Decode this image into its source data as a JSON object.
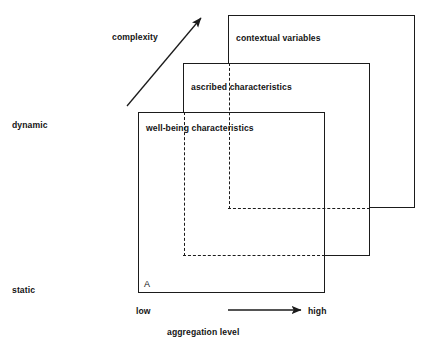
{
  "figure": {
    "clipped_title": "social architecture",
    "corner_mark": "14",
    "boxes": [
      {
        "id": "contextual",
        "label": "contextual variables"
      },
      {
        "id": "ascribed",
        "label": "ascribed characteristics"
      },
      {
        "id": "wellbeing",
        "label": "well-being characteristics"
      }
    ],
    "annotations": {
      "complexity": "complexity",
      "point_marker": "A"
    },
    "y_axis": {
      "top_label": "dynamic",
      "bottom_label": "static"
    },
    "x_axis": {
      "low_label": "low",
      "high_label": "high",
      "caption": "aggregation level"
    },
    "colors": {
      "line": "#1b1b1b",
      "text": "#141414",
      "background": "#ffffff"
    }
  }
}
